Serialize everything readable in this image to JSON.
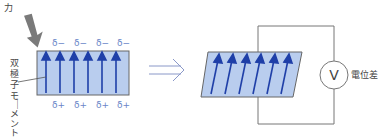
{
  "labels": {
    "force": "力",
    "dipole_moment": "双極子モーメント",
    "potential_difference": "電位差",
    "voltmeter": "V",
    "delta_minus": "δ−",
    "delta_plus": "δ+"
  },
  "colors": {
    "crystal_fill": "#b9cdee",
    "arrow": "#1f3fa8",
    "outline": "#666666",
    "force_arrow": "#777777",
    "delta_text": "#6a86c8"
  }
}
